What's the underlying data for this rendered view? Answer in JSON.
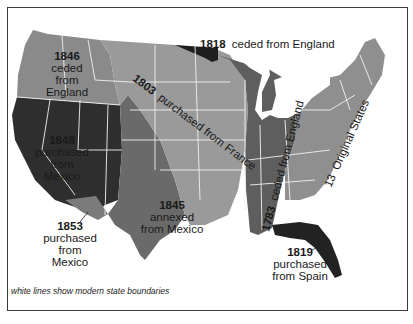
{
  "regions": [
    {
      "id": "original-13",
      "year": "13",
      "text": "Original States",
      "color": "#8f8f8f"
    },
    {
      "id": "cession-1783",
      "year": "1783",
      "text": "ceded from England",
      "color": "#5e5e5e"
    },
    {
      "id": "louisiana-1803",
      "year": "1803",
      "text": "purchased from France",
      "color": "#9a9a9a"
    },
    {
      "id": "red-river-1818",
      "year": "1818",
      "text": "ceded from England",
      "color": "#1e1e1e"
    },
    {
      "id": "florida-1819",
      "year": "1819",
      "text_line1": "purchased",
      "text_line2": "from Spain",
      "color": "#222222"
    },
    {
      "id": "texas-1845",
      "year": "1845",
      "text_line1": "annexed",
      "text_line2": "from Mexico",
      "color": "#6a6a6a"
    },
    {
      "id": "oregon-1846",
      "year": "1846",
      "text_line1": "ceded",
      "text_line2": "from",
      "text_line3": "England",
      "color": "#8a8a8a"
    },
    {
      "id": "cession-1848",
      "year": "1848",
      "text_line1": "purchased",
      "text_line2": "from",
      "text_line3": "Mexico",
      "color": "#2e2e2e"
    },
    {
      "id": "gadsden-1853",
      "year": "1853",
      "text_line1": "purchased",
      "text_line2": "from",
      "text_line3": "Mexico",
      "color": "#7b7b7b"
    }
  ],
  "caption": "white lines show modern state boundaries",
  "colors": {
    "frame": "#3a3a3a",
    "state_lines": "#f2f2f2",
    "background": "#ffffff"
  }
}
